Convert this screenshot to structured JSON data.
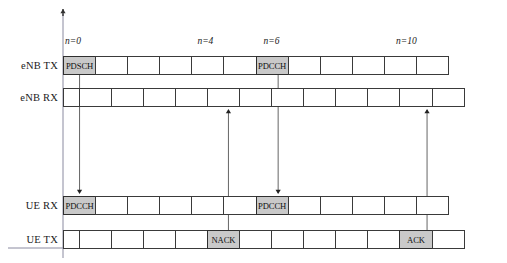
{
  "figure": {
    "type": "timing-diagram",
    "subframe_count": 12,
    "shade_color": "#c9c9c9",
    "line_color": "#3a3a3a",
    "axis_color": "#8a8aa0"
  },
  "tick_labels": [
    {
      "text": "n=0",
      "cell_index": 0
    },
    {
      "text": "n=4",
      "cell_index": 4
    },
    {
      "text": "n=6",
      "cell_index": 6
    },
    {
      "text": "n=10",
      "cell_index": 10
    }
  ],
  "rows": [
    {
      "label": "eNB TX",
      "offset": false,
      "cells": [
        {
          "text": "PDSCH",
          "shaded": true
        },
        {
          "text": "",
          "shaded": false
        },
        {
          "text": "",
          "shaded": false
        },
        {
          "text": "",
          "shaded": false
        },
        {
          "text": "",
          "shaded": false
        },
        {
          "text": "",
          "shaded": false
        },
        {
          "text": "PDCCH",
          "shaded": true
        },
        {
          "text": "",
          "shaded": false
        },
        {
          "text": "",
          "shaded": false
        },
        {
          "text": "",
          "shaded": false
        },
        {
          "text": "",
          "shaded": false
        },
        {
          "text": "",
          "shaded": false
        }
      ]
    },
    {
      "label": "eNB RX",
      "offset": true,
      "cells": [
        {
          "text": "",
          "shaded": false
        },
        {
          "text": "",
          "shaded": false
        },
        {
          "text": "",
          "shaded": false
        },
        {
          "text": "",
          "shaded": false
        },
        {
          "text": "",
          "shaded": false
        },
        {
          "text": "",
          "shaded": false
        },
        {
          "text": "",
          "shaded": false
        },
        {
          "text": "",
          "shaded": false
        },
        {
          "text": "",
          "shaded": false
        },
        {
          "text": "",
          "shaded": false
        },
        {
          "text": "",
          "shaded": false
        },
        {
          "text": "",
          "shaded": false
        }
      ]
    },
    {
      "label": "UE RX",
      "offset": false,
      "cells": [
        {
          "text": "PDCCH",
          "shaded": true
        },
        {
          "text": "",
          "shaded": false
        },
        {
          "text": "",
          "shaded": false
        },
        {
          "text": "",
          "shaded": false
        },
        {
          "text": "",
          "shaded": false
        },
        {
          "text": "",
          "shaded": false
        },
        {
          "text": "PDCCH",
          "shaded": true
        },
        {
          "text": "",
          "shaded": false
        },
        {
          "text": "",
          "shaded": false
        },
        {
          "text": "",
          "shaded": false
        },
        {
          "text": "",
          "shaded": false
        },
        {
          "text": "",
          "shaded": false
        }
      ]
    },
    {
      "label": "UE TX",
      "offset": true,
      "cells": [
        {
          "text": "",
          "shaded": false
        },
        {
          "text": "",
          "shaded": false
        },
        {
          "text": "",
          "shaded": false
        },
        {
          "text": "",
          "shaded": false
        },
        {
          "text": "NACK",
          "shaded": true
        },
        {
          "text": "",
          "shaded": false
        },
        {
          "text": "",
          "shaded": false
        },
        {
          "text": "",
          "shaded": false
        },
        {
          "text": "",
          "shaded": false
        },
        {
          "text": "",
          "shaded": false
        },
        {
          "text": "ACK",
          "shaded": true
        },
        {
          "text": "",
          "shaded": false
        }
      ]
    }
  ],
  "arrows": [
    {
      "name": "pdsch-downlink-arrow",
      "from_row": "eNB TX",
      "to_row": "UE RX",
      "cell_index": 0,
      "direction": "down"
    },
    {
      "name": "nack-uplink-arrow",
      "from_row": "UE TX",
      "to_row": "eNB RX",
      "cell_index": 4,
      "direction": "up"
    },
    {
      "name": "pdcch-downlink-arrow",
      "from_row": "eNB TX",
      "to_row": "UE RX",
      "cell_index": 6,
      "direction": "down"
    },
    {
      "name": "ack-uplink-arrow",
      "from_row": "UE TX",
      "to_row": "eNB RX",
      "cell_index": 10,
      "direction": "up"
    }
  ],
  "time_axis": {
    "name": "time-reference-axis",
    "direction": "up"
  }
}
